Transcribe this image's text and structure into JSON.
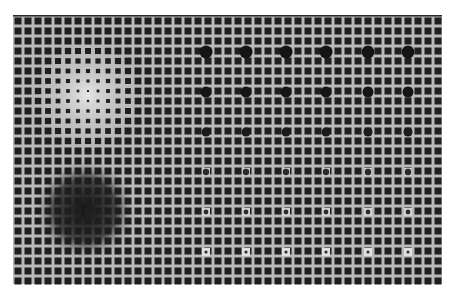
{
  "artwork": {
    "title": "Op-art square grid with gradient distortions and circle array",
    "background": "#ffffff",
    "grid": {
      "x": 13,
      "y": 16,
      "width": 429,
      "height": 268,
      "pitch": 10,
      "square": 7,
      "cols": 43,
      "rows": 27,
      "gap_color": "#b9b9b9",
      "square_color": "#1e1e1e",
      "border_color": "#2a2a2a"
    },
    "light_spot": {
      "cx": 87,
      "cy": 95,
      "r": 55,
      "gap_color": "#e6e6e6",
      "min_square": 1.5
    },
    "dark_spot": {
      "cx": 85,
      "cy": 210,
      "r": 52,
      "gap_color": "#141414"
    },
    "slanted_column": {
      "x": 160,
      "y_start": 85,
      "y_end": 228,
      "color": "#1e1e1e"
    },
    "circles": {
      "columns_x": [
        206,
        246,
        286,
        326,
        368,
        408
      ],
      "rows": [
        {
          "y": 52,
          "r": 6.5,
          "fill": "#141414",
          "halo": null
        },
        {
          "y": 92,
          "r": 5.5,
          "fill": "#141414",
          "halo": null
        },
        {
          "y": 132,
          "r": 4.5,
          "fill": "#1a1a1a",
          "halo": null
        },
        {
          "y": 172,
          "r": 3.2,
          "fill": "#2a2a2a",
          "halo": "#c8c8c8"
        },
        {
          "y": 212,
          "r": 2.4,
          "fill": "#2a2a2a",
          "halo": "#d4d4d4"
        },
        {
          "y": 252,
          "r": 1.6,
          "fill": "#333333",
          "halo": "#e0e0e0"
        }
      ]
    }
  }
}
